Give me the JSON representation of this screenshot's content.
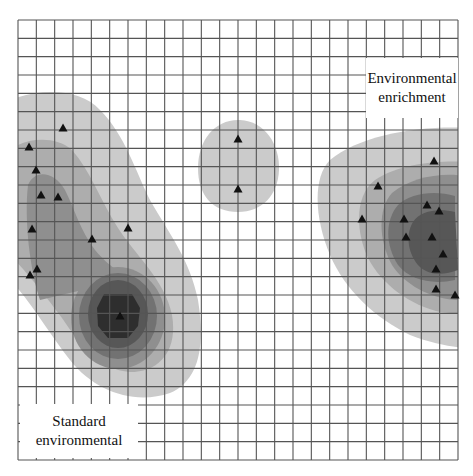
{
  "figure": {
    "type": "heatmap",
    "grid": {
      "x0": 18,
      "y0": 20,
      "x1": 458,
      "y1": 460,
      "cols": 24,
      "rows": 24,
      "line_color": "#555555"
    },
    "shades": [
      "#cbcbcb",
      "#adadad",
      "#8f8f8f",
      "#727272",
      "#575757",
      "#2e2e2e"
    ],
    "labels": {
      "enrichment": {
        "line1": "Environmental",
        "line2": "enrichment"
      },
      "standard": {
        "line1": "Standard",
        "line2": "environmental"
      }
    }
  },
  "chart_data": {
    "type": "heatmap",
    "title": "",
    "legend": [
      "Standard environmental",
      "Environmental enrichment"
    ],
    "grid": "on",
    "clusters": [
      {
        "name": "Standard environmental",
        "density_levels": 6,
        "peak_pixel": [
          120,
          312
        ],
        "points_pixel": [
          [
            63,
            128
          ],
          [
            29,
            147
          ],
          [
            36,
            170
          ],
          [
            41,
            195
          ],
          [
            58,
            197
          ],
          [
            32,
            229
          ],
          [
            92,
            239
          ],
          [
            128,
            228
          ],
          [
            37,
            269
          ],
          [
            30,
            275
          ],
          [
            120,
            316
          ]
        ]
      },
      {
        "name": "Middle cluster",
        "density_levels": 1,
        "peak_pixel": [
          238,
          171
        ],
        "points_pixel": [
          [
            238,
            139
          ],
          [
            238,
            189
          ]
        ]
      },
      {
        "name": "Environmental enrichment",
        "density_levels": 5,
        "peak_pixel": [
          420,
          240
        ],
        "points_pixel": [
          [
            434,
            161
          ],
          [
            378,
            186
          ],
          [
            427,
            205
          ],
          [
            439,
            211
          ],
          [
            362,
            219
          ],
          [
            404,
            219
          ],
          [
            406,
            237
          ],
          [
            432,
            237
          ],
          [
            443,
            254
          ],
          [
            436,
            269
          ],
          [
            436,
            289
          ],
          [
            455,
            295
          ]
        ]
      }
    ]
  }
}
